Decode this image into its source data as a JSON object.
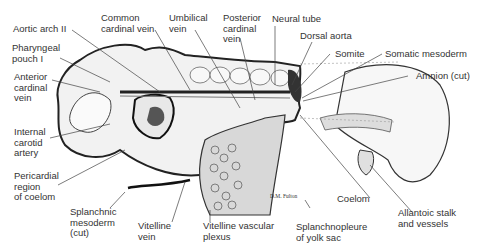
{
  "figure": {
    "signature": "D.M. Fulton",
    "labels": [
      {
        "id": "aortic-arch-ii",
        "text": "Aortic arch II"
      },
      {
        "id": "pharyngeal-pouch-i",
        "text": "Pharyngeal\npouch I"
      },
      {
        "id": "anterior-cardinal-vein",
        "text": "Anterior\ncardinal\nvein"
      },
      {
        "id": "internal-carotid-artery",
        "text": "Internal\ncarotid\nartery"
      },
      {
        "id": "pericardial-region",
        "text": "Pericardial\nregion\nof coelom"
      },
      {
        "id": "splanchnic-mesoderm",
        "text": "Splanchnic\nmesoderm\n(cut)"
      },
      {
        "id": "vitelline-vein",
        "text": "Vitelline\nvein"
      },
      {
        "id": "vitelline-vascular-plexus",
        "text": "Vitelline vascular\nplexus"
      },
      {
        "id": "common-cardinal-vein",
        "text": "Common\ncardinal vein"
      },
      {
        "id": "umbilical-vein",
        "text": "Umbilical\nvein"
      },
      {
        "id": "posterior-cardinal-vein",
        "text": "Posterior\ncardinal\nvein"
      },
      {
        "id": "neural-tube",
        "text": "Neural tube"
      },
      {
        "id": "dorsal-aorta",
        "text": "Dorsal aorta"
      },
      {
        "id": "somite",
        "text": "Somite"
      },
      {
        "id": "somatic-mesoderm",
        "text": "Somatic mesoderm"
      },
      {
        "id": "amnion-cut",
        "text": "Amnion (cut)"
      },
      {
        "id": "coelom",
        "text": "Coelom"
      },
      {
        "id": "splanchnopleure",
        "text": "Splanchnopleure\nof yolk sac"
      },
      {
        "id": "allantoic-stalk",
        "text": "Allantoic stalk\nand vessels"
      }
    ]
  }
}
